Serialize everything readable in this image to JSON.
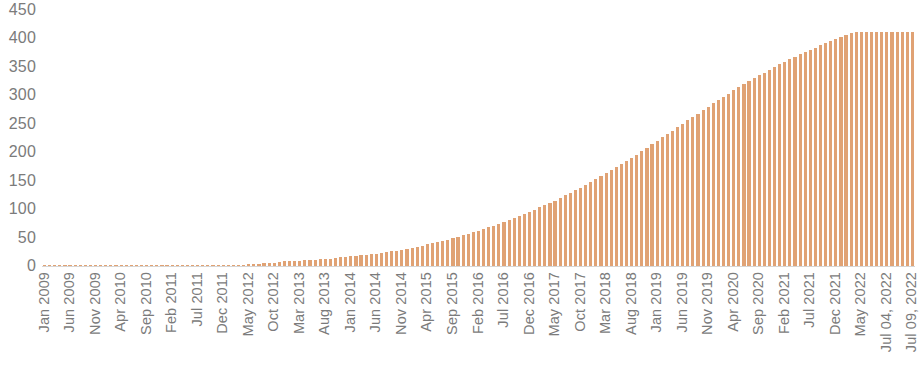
{
  "chart_data": {
    "type": "bar",
    "title": "",
    "subtitle": "",
    "xlabel": "",
    "ylabel": "",
    "ylim": [
      0,
      450
    ],
    "y_ticks": [
      450,
      400,
      350,
      300,
      250,
      200,
      150,
      100,
      50,
      0
    ],
    "grid": false,
    "legend": "none",
    "bar_color": "#e0a274",
    "axis_text_color": "#7b7b7b",
    "baseline_color": "#d6d6d6",
    "x_tick_labels": [
      "Jan 2009",
      "Jun 2009",
      "Nov 2009",
      "Apr 2010",
      "Sep 2010",
      "Feb 2011",
      "Jul 2011",
      "Dec 2011",
      "May 2012",
      "Oct 2012",
      "Mar 2013",
      "Aug 2013",
      "Jan 2014",
      "Jun 2014",
      "Nov 2014",
      "Apr 2015",
      "Sep 2015",
      "Feb 2016",
      "Jul 2016",
      "Dec 2016",
      "May 2017",
      "Oct 2017",
      "Mar 2018",
      "Aug 2018",
      "Jan 2019",
      "Jun 2019",
      "Nov 2019",
      "Apr 2020",
      "Sep 2020",
      "Feb 2021",
      "Jul 2021",
      "Dec 2021",
      "May 2022",
      "Jul 04, 2022",
      "Jul 09, 2022"
    ],
    "x_tick_step": 5,
    "categories": [
      "Jan 2009",
      "Feb 2009",
      "Mar 2009",
      "Apr 2009",
      "May 2009",
      "Jun 2009",
      "Jul 2009",
      "Aug 2009",
      "Sep 2009",
      "Oct 2009",
      "Nov 2009",
      "Dec 2009",
      "Jan 2010",
      "Feb 2010",
      "Mar 2010",
      "Apr 2010",
      "May 2010",
      "Jun 2010",
      "Jul 2010",
      "Aug 2010",
      "Sep 2010",
      "Oct 2010",
      "Nov 2010",
      "Dec 2010",
      "Jan 2011",
      "Feb 2011",
      "Mar 2011",
      "Apr 2011",
      "May 2011",
      "Jun 2011",
      "Jul 2011",
      "Aug 2011",
      "Sep 2011",
      "Oct 2011",
      "Nov 2011",
      "Dec 2011",
      "Jan 2012",
      "Feb 2012",
      "Mar 2012",
      "Apr 2012",
      "May 2012",
      "Jun 2012",
      "Jul 2012",
      "Aug 2012",
      "Sep 2012",
      "Oct 2012",
      "Nov 2012",
      "Dec 2012",
      "Jan 2013",
      "Feb 2013",
      "Mar 2013",
      "Apr 2013",
      "May 2013",
      "Jun 2013",
      "Jul 2013",
      "Aug 2013",
      "Sep 2013",
      "Oct 2013",
      "Nov 2013",
      "Dec 2013",
      "Jan 2014",
      "Feb 2014",
      "Mar 2014",
      "Apr 2014",
      "May 2014",
      "Jun 2014",
      "Jul 2014",
      "Aug 2014",
      "Sep 2014",
      "Oct 2014",
      "Nov 2014",
      "Dec 2014",
      "Jan 2015",
      "Feb 2015",
      "Mar 2015",
      "Apr 2015",
      "May 2015",
      "Jun 2015",
      "Jul 2015",
      "Aug 2015",
      "Sep 2015",
      "Oct 2015",
      "Nov 2015",
      "Dec 2015",
      "Jan 2016",
      "Feb 2016",
      "Mar 2016",
      "Apr 2016",
      "May 2016",
      "Jun 2016",
      "Jul 2016",
      "Aug 2016",
      "Sep 2016",
      "Oct 2016",
      "Nov 2016",
      "Dec 2016",
      "Jan 2017",
      "Feb 2017",
      "Mar 2017",
      "Apr 2017",
      "May 2017",
      "Jun 2017",
      "Jul 2017",
      "Aug 2017",
      "Sep 2017",
      "Oct 2017",
      "Nov 2017",
      "Dec 2017",
      "Jan 2018",
      "Feb 2018",
      "Mar 2018",
      "Apr 2018",
      "May 2018",
      "Jun 2018",
      "Jul 2018",
      "Aug 2018",
      "Sep 2018",
      "Oct 2018",
      "Nov 2018",
      "Dec 2018",
      "Jan 2019",
      "Feb 2019",
      "Mar 2019",
      "Apr 2019",
      "May 2019",
      "Jun 2019",
      "Jul 2019",
      "Aug 2019",
      "Sep 2019",
      "Oct 2019",
      "Nov 2019",
      "Dec 2019",
      "Jan 2020",
      "Feb 2020",
      "Mar 2020",
      "Apr 2020",
      "May 2020",
      "Jun 2020",
      "Jul 2020",
      "Aug 2020",
      "Sep 2020",
      "Oct 2020",
      "Nov 2020",
      "Dec 2020",
      "Jan 2021",
      "Feb 2021",
      "Mar 2021",
      "Apr 2021",
      "May 2021",
      "Jun 2021",
      "Jul 2021",
      "Aug 2021",
      "Sep 2021",
      "Oct 2021",
      "Nov 2021",
      "Dec 2021",
      "Jan 2022",
      "Feb 2022",
      "Mar 2022",
      "Apr 2022",
      "May 2022",
      "Jun 2022",
      "Jul 01, 2022",
      "Jul 02, 2022",
      "Jul 03, 2022",
      "Jul 04, 2022",
      "Jul 05, 2022",
      "Jul 06, 2022",
      "Jul 07, 2022",
      "Jul 08, 2022",
      "Jul 09, 2022"
    ],
    "values": [
      0,
      0,
      0,
      0,
      0,
      0,
      0,
      0,
      0,
      0,
      0,
      0,
      0,
      0,
      0,
      0,
      0,
      0,
      0,
      0,
      0,
      0,
      0,
      0,
      0,
      0,
      0,
      0,
      0,
      0,
      0,
      0,
      0,
      0,
      0,
      1,
      1,
      1,
      2,
      2,
      3,
      4,
      4,
      5,
      6,
      6,
      7,
      8,
      8,
      9,
      9,
      10,
      11,
      11,
      12,
      13,
      13,
      14,
      15,
      16,
      17,
      18,
      19,
      20,
      21,
      22,
      23,
      25,
      26,
      27,
      29,
      30,
      32,
      34,
      36,
      38,
      40,
      42,
      44,
      46,
      49,
      51,
      54,
      56,
      59,
      62,
      65,
      68,
      71,
      74,
      77,
      81,
      84,
      88,
      91,
      95,
      99,
      103,
      107,
      111,
      115,
      120,
      124,
      129,
      133,
      138,
      143,
      148,
      153,
      158,
      163,
      168,
      174,
      179,
      185,
      190,
      196,
      202,
      208,
      214,
      220,
      226,
      232,
      238,
      244,
      250,
      256,
      262,
      268,
      274,
      280,
      286,
      292,
      297,
      303,
      309,
      314,
      320,
      325,
      330,
      335,
      340,
      345,
      350,
      355,
      359,
      364,
      368,
      372,
      376,
      380,
      384,
      388,
      392,
      396,
      399,
      403,
      406,
      409,
      411,
      412,
      412,
      412,
      412,
      412,
      412,
      412,
      412,
      412,
      412,
      412
    ]
  }
}
